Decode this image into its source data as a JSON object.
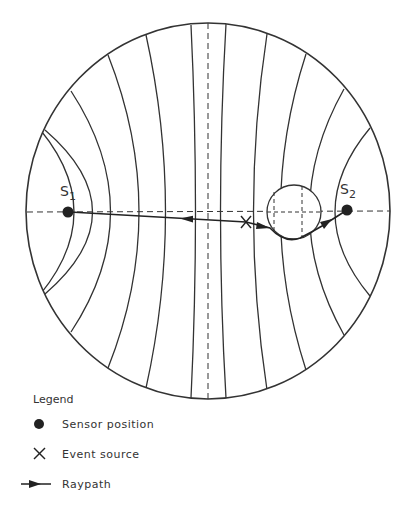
{
  "diagram": {
    "boundary": {
      "cx": 208,
      "cy": 211,
      "rx": 182,
      "ry": 188
    },
    "colors": {
      "line": "#333333",
      "background": "#ffffff"
    },
    "sensors": [
      {
        "id": "S1",
        "label": "S",
        "sub": "1",
        "x": 68,
        "y": 212
      },
      {
        "id": "S2",
        "label": "S",
        "sub": "2",
        "x": 347,
        "y": 210
      }
    ],
    "event_source": {
      "label": "X",
      "x": 246,
      "y": 222
    },
    "inclusion": {
      "cx": 294,
      "cy": 212,
      "r": 27
    }
  },
  "legend": {
    "title": "Legend",
    "items": [
      {
        "symbol": "dot",
        "label": "Sensor position"
      },
      {
        "symbol": "cross",
        "label": "Event source"
      },
      {
        "symbol": "arrow",
        "label": "Raypath"
      }
    ]
  }
}
